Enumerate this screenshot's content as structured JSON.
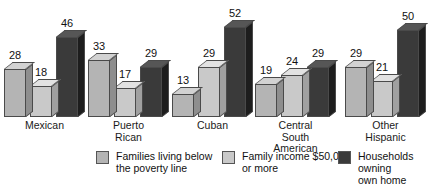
{
  "chart_data": {
    "type": "bar",
    "title": "",
    "subtitle": "",
    "xlabel": "",
    "ylabel": "",
    "ylim": [
      0,
      52
    ],
    "grid": false,
    "legend_position": "bottom",
    "value_labels": true,
    "style": "3d-bars-grayscale",
    "categories": [
      "Mexican",
      "Puerto Rican",
      "Cuban",
      "Central South\nAmerican",
      "Other\nHispanic"
    ],
    "series": [
      {
        "name": "Families living below\nthe poverty line",
        "color": "#b4b4b4",
        "values": [
          28,
          33,
          13,
          19,
          29
        ]
      },
      {
        "name": "Family income $50,000\nor more",
        "color": "#c9c9c9",
        "values": [
          18,
          17,
          29,
          24,
          21
        ]
      },
      {
        "name": "Households owning\nown home",
        "color": "#3a3a3a",
        "values": [
          46,
          29,
          52,
          29,
          50
        ]
      }
    ]
  },
  "groups": [
    {
      "label": "Mexican",
      "values": [
        28,
        18,
        46
      ]
    },
    {
      "label": "Puerto Rican",
      "values": [
        33,
        17,
        29
      ]
    },
    {
      "label": "Cuban",
      "values": [
        13,
        29,
        52
      ]
    },
    {
      "label": "Central South\nAmerican",
      "values": [
        19,
        24,
        29
      ]
    },
    {
      "label": "Other\nHispanic",
      "values": [
        29,
        21,
        50
      ]
    }
  ],
  "legend": [
    {
      "label": "Families living below\nthe poverty line",
      "color": "#b4b4b4"
    },
    {
      "label": "Family income $50,000\nor more",
      "color": "#c9c9c9"
    },
    {
      "label": "Households owning\nown home",
      "color": "#3a3a3a"
    }
  ]
}
